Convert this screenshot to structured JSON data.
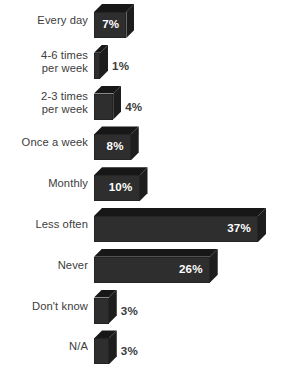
{
  "chart_data": {
    "type": "bar",
    "orientation": "horizontal",
    "style": "3d-extruded",
    "title": "",
    "subtitle": "",
    "xlabel": "",
    "ylabel": "",
    "grid": false,
    "legend": false,
    "axis_visible": false,
    "value_suffix": "%",
    "xlim": [
      0,
      37
    ],
    "categories": [
      "Every day",
      "4-6 times\nper week",
      "2-3 times\nper week",
      "Once a week",
      "Monthly",
      "Less often",
      "Never",
      "Don't know",
      "N/A"
    ],
    "values": [
      7,
      1,
      4,
      8,
      10,
      37,
      26,
      3,
      3
    ],
    "value_labels": [
      "7%",
      "1%",
      "4%",
      "8%",
      "10%",
      "37%",
      "26%",
      "3%",
      "3%"
    ],
    "label_placement": [
      "inside",
      "outside",
      "outside",
      "inside",
      "inside",
      "inside",
      "inside",
      "outside",
      "outside"
    ],
    "colors": {
      "background": "#ffffff",
      "bar_front": "#2e2e2e",
      "bar_top": "#171717",
      "bar_side": "#1d1d1d",
      "category_text": "#3c3c3c",
      "value_text_inside": "#ffffff",
      "value_text_outside": "#3c3c3c"
    }
  },
  "rows": [
    {
      "label": "Every day",
      "value": 7,
      "value_label": "7%",
      "placement": "inside"
    },
    {
      "label": "4-6 times\nper week",
      "value": 1,
      "value_label": "1%",
      "placement": "outside"
    },
    {
      "label": "2-3 times\nper week",
      "value": 4,
      "value_label": "4%",
      "placement": "outside"
    },
    {
      "label": "Once a week",
      "value": 8,
      "value_label": "8%",
      "placement": "inside"
    },
    {
      "label": "Monthly",
      "value": 10,
      "value_label": "10%",
      "placement": "inside"
    },
    {
      "label": "Less often",
      "value": 37,
      "value_label": "37%",
      "placement": "inside"
    },
    {
      "label": "Never",
      "value": 26,
      "value_label": "26%",
      "placement": "inside"
    },
    {
      "label": "Don't know",
      "value": 3,
      "value_label": "3%",
      "placement": "outside"
    },
    {
      "label": "N/A",
      "value": 3,
      "value_label": "3%",
      "placement": "outside"
    }
  ]
}
